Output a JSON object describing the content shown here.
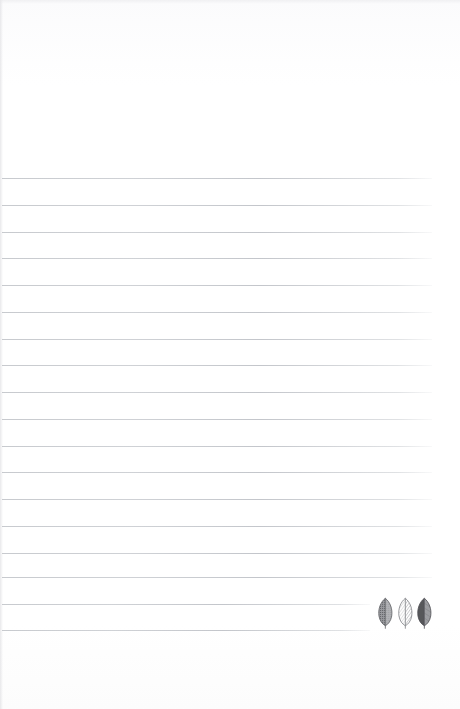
{
  "document": {
    "kind": "lined-notepaper-scan",
    "title": "Blank ruled notepaper page",
    "width": 460,
    "height": 709,
    "background_color": "#fefefe",
    "written_text": "",
    "top_margin_label": "",
    "bottom_margin_label": ""
  },
  "ruling": {
    "line_color": "#c9ccd1",
    "line_thickness_px": 1,
    "first_line_y": 178,
    "line_spacing_px": 26.8,
    "line_count": 18,
    "left_x": 2,
    "right_x": 432,
    "short_line_right_x": 370,
    "short_line_indices": [
      16,
      17
    ],
    "lines": [
      {
        "y": 178,
        "x1": 2,
        "x2": 432
      },
      {
        "y": 205,
        "x1": 2,
        "x2": 432
      },
      {
        "y": 232,
        "x1": 2,
        "x2": 432
      },
      {
        "y": 258,
        "x1": 2,
        "x2": 432
      },
      {
        "y": 285,
        "x1": 2,
        "x2": 432
      },
      {
        "y": 312,
        "x1": 2,
        "x2": 432
      },
      {
        "y": 339,
        "x1": 2,
        "x2": 432
      },
      {
        "y": 365,
        "x1": 2,
        "x2": 432
      },
      {
        "y": 392,
        "x1": 2,
        "x2": 432
      },
      {
        "y": 419,
        "x1": 2,
        "x2": 432
      },
      {
        "y": 446,
        "x1": 2,
        "x2": 432
      },
      {
        "y": 472,
        "x1": 2,
        "x2": 432
      },
      {
        "y": 499,
        "x1": 2,
        "x2": 432
      },
      {
        "y": 526,
        "x1": 2,
        "x2": 432
      },
      {
        "y": 553,
        "x1": 2,
        "x2": 432
      },
      {
        "y": 577,
        "x1": 2,
        "x2": 432
      },
      {
        "y": 604,
        "x1": 2,
        "x2": 370
      },
      {
        "y": 630,
        "x1": 2,
        "x2": 370
      }
    ]
  },
  "decoration": {
    "name": "leaf-trio-illustration",
    "description": "Three small botanical leaf drawings at lower right corner",
    "x": 376,
    "y": 596,
    "width": 58,
    "height": 34,
    "leaves": [
      {
        "name": "leaf-stippled",
        "fill_left": "#6e6f72",
        "fill_right": "#b7b8bb",
        "outline": "#5e5f63",
        "pattern": "stipple-dots"
      },
      {
        "name": "leaf-hatched",
        "fill_left": "#fdfdfd",
        "fill_right": "#f4f4f5",
        "outline": "#8a8b8f",
        "pattern": "diagonal-hatch"
      },
      {
        "name": "leaf-solid",
        "fill_left": "#56575a",
        "fill_right": "#9b9ca0",
        "outline": "#4c4d51",
        "pattern": "solid-tone"
      }
    ]
  }
}
